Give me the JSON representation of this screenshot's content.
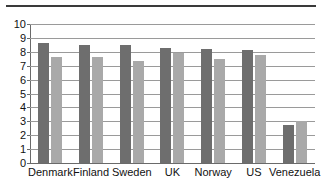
{
  "chart_data": {
    "type": "bar",
    "title": "",
    "subtitle": "",
    "xlabel": "",
    "ylabel": "",
    "ylim": [
      0,
      10
    ],
    "yticks": [
      0,
      1,
      2,
      3,
      4,
      5,
      6,
      7,
      8,
      9,
      10
    ],
    "grid": true,
    "legend": "none",
    "orientation": "vertical",
    "grouping": "grouped",
    "categories": [
      "Denmark",
      "Finland",
      "Sweden",
      "UK",
      "Norway",
      "US",
      "Venezuela"
    ],
    "series": [
      {
        "name": "series-1",
        "color": "#6e6e6e",
        "values": [
          8.6,
          8.5,
          8.5,
          8.3,
          8.2,
          8.1,
          2.7
        ]
      },
      {
        "name": "series-2",
        "color": "#a9a9a9",
        "values": [
          7.6,
          7.65,
          7.35,
          7.9,
          7.5,
          7.8,
          3.0
        ]
      }
    ]
  },
  "figure": {
    "top_rule_color": "#3a3a3a",
    "axis_color": "#6a6a6a",
    "grid_color": "#9a9a9a",
    "background": "#ffffff"
  }
}
